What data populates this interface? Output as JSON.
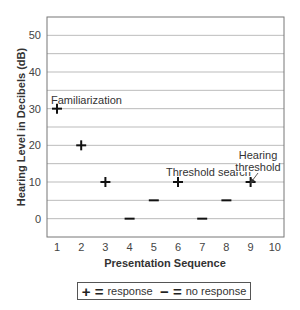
{
  "chart_data": {
    "type": "scatter",
    "title": "",
    "xlabel": "Presentation Sequence",
    "ylabel": "Hearing Level in Decibels (dB)",
    "xlim": [
      0.5,
      10.5
    ],
    "ylim": [
      -5,
      55
    ],
    "x_ticks": [
      1,
      2,
      3,
      4,
      5,
      6,
      7,
      8,
      9,
      10
    ],
    "y_ticks": [
      0,
      10,
      20,
      30,
      40,
      50
    ],
    "grid": "horizontal every 5 dB",
    "points": [
      {
        "x": 1,
        "y": 30,
        "marker": "+",
        "meaning": "response"
      },
      {
        "x": 2,
        "y": 20,
        "marker": "+",
        "meaning": "response"
      },
      {
        "x": 3,
        "y": 10,
        "marker": "+",
        "meaning": "response"
      },
      {
        "x": 4,
        "y": 0,
        "marker": "-",
        "meaning": "no response"
      },
      {
        "x": 5,
        "y": 5,
        "marker": "-",
        "meaning": "no response"
      },
      {
        "x": 6,
        "y": 10,
        "marker": "+",
        "meaning": "response"
      },
      {
        "x": 7,
        "y": 0,
        "marker": "-",
        "meaning": "no response"
      },
      {
        "x": 8,
        "y": 5,
        "marker": "-",
        "meaning": "no response"
      },
      {
        "x": 9,
        "y": 10,
        "marker": "+",
        "meaning": "response"
      }
    ],
    "annotations": [
      {
        "text": "Familiarization",
        "near": {
          "x": 1,
          "y": 30
        }
      },
      {
        "text": "Threshold search",
        "near": {
          "x": 6,
          "y": 10
        }
      },
      {
        "text": "Hearing threshold",
        "near": {
          "x": 9,
          "y": 10
        },
        "arrow": true
      }
    ],
    "legend": [
      {
        "symbol": "+",
        "label": "response"
      },
      {
        "symbol": "−",
        "label": "no response"
      }
    ],
    "legend_position": "bottom"
  },
  "labels": {
    "xlabel": "Presentation Sequence",
    "ylabel": "Hearing Level in Decibels (dB)",
    "annot_familiarization": "Familiarization",
    "annot_threshold_search": "Threshold search",
    "annot_hearing": "Hearing",
    "annot_threshold": "threshold"
  },
  "legend": {
    "plus_symbol": "+ =",
    "plus_label": "response",
    "minus_symbol": "− =",
    "minus_label": "no response"
  }
}
